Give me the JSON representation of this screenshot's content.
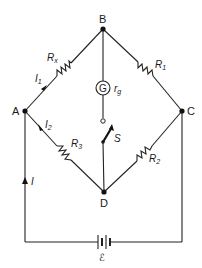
{
  "diagram": {
    "type": "circuit",
    "nodes": [
      {
        "id": "A",
        "label": "A",
        "x": 25,
        "y": 111
      },
      {
        "id": "B",
        "label": "B",
        "x": 103,
        "y": 29
      },
      {
        "id": "C",
        "label": "C",
        "x": 182,
        "y": 111
      },
      {
        "id": "D",
        "label": "D",
        "x": 104,
        "y": 192
      }
    ],
    "components": {
      "rx": {
        "label": "R",
        "sub": "x",
        "between": [
          "A",
          "B"
        ]
      },
      "r1": {
        "label": "R",
        "sub": "1",
        "between": [
          "B",
          "C"
        ]
      },
      "r3": {
        "label": "R",
        "sub": "3",
        "between": [
          "A",
          "D"
        ]
      },
      "r2": {
        "label": "R",
        "sub": "2",
        "between": [
          "D",
          "C"
        ]
      },
      "galvanometer": {
        "symbol": "G",
        "label": "r",
        "sub": "g",
        "between": [
          "B",
          "D"
        ]
      },
      "switch": {
        "label": "S",
        "between": [
          "B",
          "D"
        ]
      },
      "battery": {
        "label": "ℰ",
        "between": [
          "A",
          "C"
        ]
      }
    },
    "currents": {
      "i1": {
        "label": "I",
        "sub": "1",
        "branch": "A-B"
      },
      "i2": {
        "label": "I",
        "sub": "2",
        "branch": "A-D"
      },
      "i": {
        "label": "I",
        "branch": "battery-A"
      }
    },
    "colors": {
      "line": "#222222",
      "background": "#ffffff"
    }
  }
}
